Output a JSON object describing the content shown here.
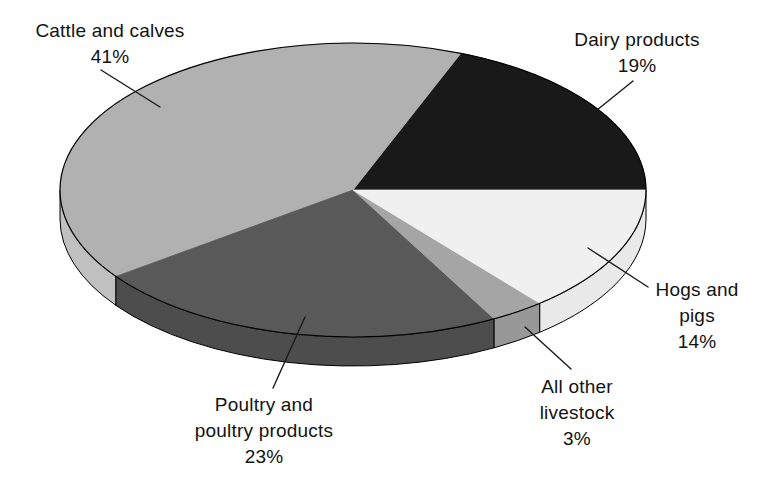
{
  "canvas": {
    "background": "#ffffff"
  },
  "chart_data": {
    "type": "pie",
    "style": "3d-ellipse",
    "title": "",
    "unit": "percent",
    "legend": "none",
    "categories": [
      "Cattle and calves",
      "Dairy products",
      "Hogs and pigs",
      "All other livestock",
      "Poultry and poultry products"
    ],
    "values": [
      41,
      19,
      14,
      3,
      23
    ],
    "start_angle_deg": 0,
    "direction": "counterclockwise",
    "outline_color": "#000000",
    "leader_line_color": "#1a1a1a",
    "slices": [
      {
        "name": "Dairy products",
        "pct": 19,
        "top_color": "#191919",
        "side_color": "#0f0f0f",
        "label_lines": [
          "Dairy products",
          "19%"
        ]
      },
      {
        "name": "Cattle and calves",
        "pct": 41,
        "top_color": "#b1b1b1",
        "side_color": "#c0c0c0",
        "label_lines": [
          "Cattle and calves",
          "41%"
        ]
      },
      {
        "name": "Poultry and poultry products",
        "pct": 23,
        "top_color": "#595959",
        "side_color": "#4d4d4d",
        "label_lines": [
          "Poultry and",
          "poultry products",
          "23%"
        ]
      },
      {
        "name": "All other livestock",
        "pct": 3,
        "top_color": "#a5a5a5",
        "side_color": "#989898",
        "label_lines": [
          "All other",
          "livestock",
          "3%"
        ]
      },
      {
        "name": "Hogs and pigs",
        "pct": 14,
        "top_color": "#f0f0f0",
        "side_color": "#e9e9e9",
        "label_lines": [
          "Hogs and",
          "pigs",
          "14%"
        ]
      }
    ]
  }
}
